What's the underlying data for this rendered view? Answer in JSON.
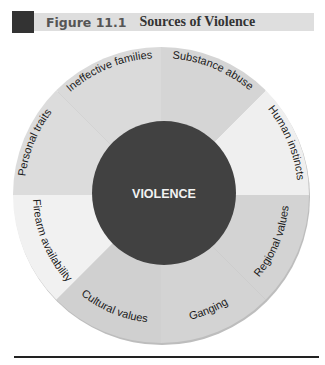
{
  "figure": {
    "label": "Figure 11.1",
    "title": "Sources of Violence"
  },
  "diagram": {
    "center_label": "VIOLENCE",
    "center_color": "#414141",
    "segments": [
      {
        "label": "Human instincts",
        "color": "#efefef"
      },
      {
        "label": "Regional values",
        "color": "#d3d3d3"
      },
      {
        "label": "Ganging",
        "color": "#d3d3d3"
      },
      {
        "label": "Cultural values",
        "color": "#d0d0d0"
      },
      {
        "label": "Firearm availability",
        "color": "#f1f1f1"
      },
      {
        "label": "Personal traits",
        "color": "#dcdcdc"
      },
      {
        "label": "Ineffective families",
        "color": "#dadada"
      },
      {
        "label": "Substance abuse",
        "color": "#d5d5d5"
      }
    ]
  }
}
